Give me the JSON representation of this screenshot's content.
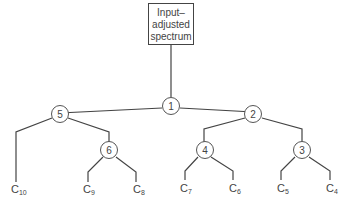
{
  "root_box": {
    "line1": "Input–",
    "line2": "adjusted",
    "line3": "spectrum"
  },
  "nodes": {
    "n1": "1",
    "n2": "2",
    "n3": "3",
    "n4": "4",
    "n5": "5",
    "n6": "6"
  },
  "leaves": {
    "c10": {
      "base": "C",
      "sub": "10"
    },
    "c9": {
      "base": "C",
      "sub": "9"
    },
    "c8": {
      "base": "C",
      "sub": "8"
    },
    "c7": {
      "base": "C",
      "sub": "7"
    },
    "c6": {
      "base": "C",
      "sub": "6"
    },
    "c5": {
      "base": "C",
      "sub": "5"
    },
    "c4": {
      "base": "C",
      "sub": "4"
    }
  }
}
